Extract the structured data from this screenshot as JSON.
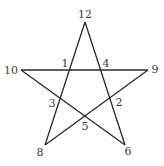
{
  "diagram": {
    "type": "pentagram",
    "stroke_color": "#2a2a2a",
    "label_color": "#3a3a3a",
    "vertices": [
      {
        "id": "12",
        "label": "12",
        "x": 85,
        "y": 22,
        "lx": 85,
        "ly": 18
      },
      {
        "id": "9",
        "label": "9",
        "x": 148,
        "y": 70,
        "lx": 155,
        "ly": 73
      },
      {
        "id": "6",
        "label": "6",
        "x": 125,
        "y": 145,
        "lx": 128,
        "ly": 155
      },
      {
        "id": "8",
        "label": "8",
        "x": 45,
        "y": 145,
        "lx": 40,
        "ly": 156
      },
      {
        "id": "10",
        "label": "10",
        "x": 21,
        "y": 70,
        "lx": 11,
        "ly": 74
      }
    ],
    "edges": [
      [
        "12",
        "8"
      ],
      [
        "12",
        "6"
      ],
      [
        "10",
        "9"
      ],
      [
        "10",
        "6"
      ],
      [
        "9",
        "8"
      ]
    ],
    "intersections": [
      {
        "id": "1",
        "label": "1",
        "lx": 65,
        "ly": 67
      },
      {
        "id": "4",
        "label": "4",
        "lx": 106,
        "ly": 67
      },
      {
        "id": "3",
        "label": "3",
        "lx": 52,
        "ly": 107
      },
      {
        "id": "2",
        "label": "2",
        "lx": 119,
        "ly": 106
      },
      {
        "id": "5",
        "label": "5",
        "lx": 85,
        "ly": 130
      }
    ]
  }
}
